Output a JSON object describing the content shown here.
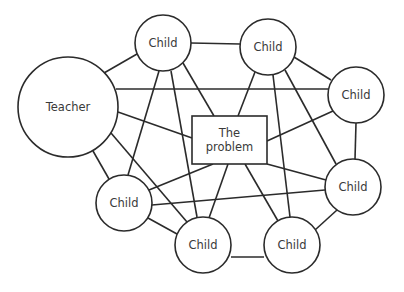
{
  "diagram": {
    "colors": {
      "stroke": "#2b2b2b",
      "text": "#3a3a3a",
      "background": "#ffffff"
    },
    "nodes": [
      {
        "id": "teacher",
        "label": "Teacher",
        "shape": "circle",
        "cx": 68,
        "cy": 107,
        "r": 50
      },
      {
        "id": "child1",
        "label": "Child",
        "shape": "circle",
        "cx": 163,
        "cy": 43,
        "r": 28
      },
      {
        "id": "child2",
        "label": "Child",
        "shape": "circle",
        "cx": 268,
        "cy": 47,
        "r": 28
      },
      {
        "id": "child3",
        "label": "Child",
        "shape": "circle",
        "cx": 356,
        "cy": 95,
        "r": 28
      },
      {
        "id": "child4",
        "label": "Child",
        "shape": "circle",
        "cx": 353,
        "cy": 187,
        "r": 28
      },
      {
        "id": "child5",
        "label": "Child",
        "shape": "circle",
        "cx": 292,
        "cy": 245,
        "r": 28
      },
      {
        "id": "child6",
        "label": "Child",
        "shape": "circle",
        "cx": 203,
        "cy": 245,
        "r": 28
      },
      {
        "id": "child7",
        "label": "Child",
        "shape": "circle",
        "cx": 124,
        "cy": 203,
        "r": 28
      },
      {
        "id": "problem",
        "label_line1": "The",
        "label_line2": "problem",
        "shape": "rect",
        "x": 192,
        "y": 116,
        "w": 75,
        "h": 48
      }
    ],
    "edges": [
      [
        "teacher",
        "child1"
      ],
      [
        "teacher",
        "child3"
      ],
      [
        "teacher",
        "problem"
      ],
      [
        "teacher",
        "child6"
      ],
      [
        "teacher",
        "child7"
      ],
      [
        "child1",
        "child2"
      ],
      [
        "child1",
        "child7"
      ],
      [
        "child1",
        "child6"
      ],
      [
        "child1",
        "problem"
      ],
      [
        "child2",
        "problem"
      ],
      [
        "child2",
        "child5"
      ],
      [
        "child2",
        "child4"
      ],
      [
        "child2",
        "child3"
      ],
      [
        "child3",
        "problem"
      ],
      [
        "child3",
        "child4"
      ],
      [
        "child4",
        "problem"
      ],
      [
        "child4",
        "child5"
      ],
      [
        "child4",
        "child7"
      ],
      [
        "child5",
        "problem"
      ],
      [
        "child5",
        "child6"
      ],
      [
        "child6",
        "problem"
      ],
      [
        "child6",
        "child7"
      ],
      [
        "child7",
        "problem"
      ]
    ]
  }
}
